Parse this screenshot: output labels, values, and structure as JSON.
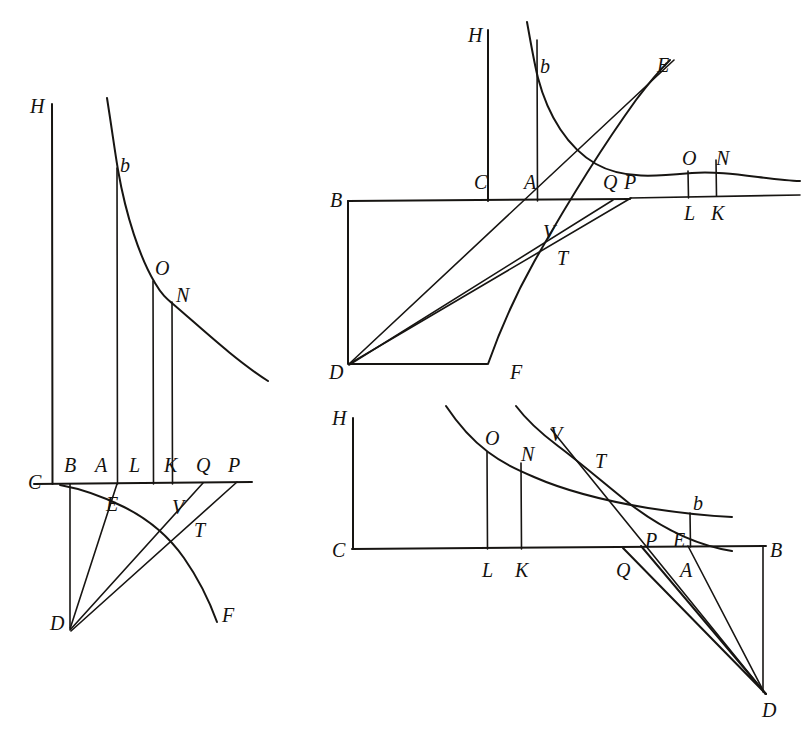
{
  "figure_set": {
    "title": "Geometric construction diagrams",
    "count": 3,
    "ink_color": "#171512",
    "background_color": "#ffffff"
  },
  "figures": [
    {
      "id": "figure-left",
      "name": "left-diagram",
      "labels": [
        {
          "key": "H",
          "text": "H",
          "x": 30,
          "y": 96
        },
        {
          "key": "b",
          "text": "b",
          "x": 120,
          "y": 155
        },
        {
          "key": "O",
          "text": "O",
          "x": 155,
          "y": 258
        },
        {
          "key": "N",
          "text": "N",
          "x": 176,
          "y": 285
        },
        {
          "key": "B",
          "text": "B",
          "x": 64,
          "y": 455
        },
        {
          "key": "A",
          "text": "A",
          "x": 95,
          "y": 455
        },
        {
          "key": "L",
          "text": "L",
          "x": 129,
          "y": 455
        },
        {
          "key": "K",
          "text": "K",
          "x": 164,
          "y": 455
        },
        {
          "key": "Q",
          "text": "Q",
          "x": 196,
          "y": 455
        },
        {
          "key": "P",
          "text": "P",
          "x": 228,
          "y": 455
        },
        {
          "key": "C",
          "text": "C",
          "x": 28,
          "y": 472
        },
        {
          "key": "E",
          "text": "E",
          "x": 106,
          "y": 494
        },
        {
          "key": "V",
          "text": "V",
          "x": 172,
          "y": 497
        },
        {
          "key": "T",
          "text": "T",
          "x": 194,
          "y": 520
        },
        {
          "key": "D",
          "text": "D",
          "x": 50,
          "y": 613
        },
        {
          "key": "F",
          "text": "F",
          "x": 222,
          "y": 605
        }
      ]
    },
    {
      "id": "figure-top-right",
      "name": "top-right-diagram",
      "labels": [
        {
          "key": "H",
          "text": "H",
          "x": 468,
          "y": 25
        },
        {
          "key": "b",
          "text": "b",
          "x": 540,
          "y": 56
        },
        {
          "key": "E",
          "text": "E",
          "x": 657,
          "y": 55
        },
        {
          "key": "O",
          "text": "O",
          "x": 682,
          "y": 148
        },
        {
          "key": "N",
          "text": "N",
          "x": 716,
          "y": 148
        },
        {
          "key": "C",
          "text": "C",
          "x": 474,
          "y": 172
        },
        {
          "key": "A",
          "text": "A",
          "x": 524,
          "y": 172
        },
        {
          "key": "Q",
          "text": "Q",
          "x": 603,
          "y": 172
        },
        {
          "key": "P",
          "text": "P",
          "x": 624,
          "y": 172
        },
        {
          "key": "B",
          "text": "B",
          "x": 330,
          "y": 190
        },
        {
          "key": "L",
          "text": "L",
          "x": 684,
          "y": 203
        },
        {
          "key": "K",
          "text": "K",
          "x": 711,
          "y": 203
        },
        {
          "key": "V",
          "text": "V",
          "x": 543,
          "y": 222
        },
        {
          "key": "T",
          "text": "T",
          "x": 557,
          "y": 248
        },
        {
          "key": "D",
          "text": "D",
          "x": 329,
          "y": 362
        },
        {
          "key": "F",
          "text": "F",
          "x": 510,
          "y": 362
        }
      ]
    },
    {
      "id": "figure-bottom-right",
      "name": "bottom-right-diagram",
      "labels": [
        {
          "key": "H",
          "text": "H",
          "x": 332,
          "y": 408
        },
        {
          "key": "O",
          "text": "O",
          "x": 485,
          "y": 428
        },
        {
          "key": "V",
          "text": "V",
          "x": 550,
          "y": 424
        },
        {
          "key": "N",
          "text": "N",
          "x": 521,
          "y": 444
        },
        {
          "key": "T",
          "text": "T",
          "x": 595,
          "y": 451
        },
        {
          "key": "b",
          "text": "b",
          "x": 693,
          "y": 493
        },
        {
          "key": "P",
          "text": "P",
          "x": 645,
          "y": 530
        },
        {
          "key": "E",
          "text": "E",
          "x": 673,
          "y": 530
        },
        {
          "key": "C",
          "text": "C",
          "x": 332,
          "y": 540
        },
        {
          "key": "B",
          "text": "B",
          "x": 770,
          "y": 540
        },
        {
          "key": "L",
          "text": "L",
          "x": 482,
          "y": 560
        },
        {
          "key": "K",
          "text": "K",
          "x": 515,
          "y": 560
        },
        {
          "key": "Q",
          "text": "Q",
          "x": 616,
          "y": 560
        },
        {
          "key": "A",
          "text": "A",
          "x": 680,
          "y": 560
        },
        {
          "key": "D",
          "text": "D",
          "x": 762,
          "y": 700
        }
      ]
    }
  ],
  "geometry": {
    "figure_left": {
      "baseline": {
        "x1": 34,
        "y1": 484,
        "x2": 252,
        "y2": 482
      },
      "vertical_H": {
        "x1": 52,
        "y1": 104,
        "x2": 52,
        "y2": 484
      },
      "vertical_A": {
        "x1": 117,
        "y1": 168,
        "x2": 117,
        "y2": 484
      },
      "vertical_L": {
        "x1": 153,
        "y1": 281,
        "x2": 153,
        "y2": 484
      },
      "vertical_K": {
        "x1": 172,
        "y1": 302,
        "x2": 172,
        "y2": 484
      },
      "vertical_B_to_D": {
        "x1": 70,
        "y1": 484,
        "x2": 70,
        "y2": 628
      },
      "hyperbola": "from (108,100) through b(117,168) O(153,281) N(172,302) to (268,380)",
      "arc_CF": "from C(62,486) through E(122,505) V(178,512) T(190,527) to F(218,622)",
      "ray_D_to_Q": {
        "x1": 70,
        "y1": 630,
        "x2": 202,
        "y2": 483
      },
      "ray_D_to_P": {
        "x1": 70,
        "y1": 630,
        "x2": 236,
        "y2": 482
      },
      "ray_D_to_E_A": {
        "x1": 70,
        "y1": 630,
        "x2": 117,
        "y2": 484
      }
    },
    "figure_top_right": {
      "baseline": {
        "x1": 348,
        "y1": 201,
        "x2": 800,
        "y2": 198
      },
      "vertical_H": {
        "x1": 487,
        "y1": 30,
        "x2": 487,
        "y2": 201
      },
      "vertical_A": {
        "x1": 537,
        "y1": 40,
        "x2": 537,
        "y2": 201
      },
      "rect_BDF": "B(348,201) D(348,364) F(487,364)",
      "vertical_L": {
        "x1": 688,
        "y1": 172,
        "x2": 688,
        "y2": 199
      },
      "vertical_K": {
        "x1": 716,
        "y1": 160,
        "x2": 716,
        "y2": 198
      },
      "hyperbola": "from (527,25) through b(537,75) down to O(688,172) N(716,180) to (800,184)",
      "arc_F": "from F(487,364) through T(553,238) to E(662,68)",
      "ray_D_to_E": {
        "x1": 348,
        "y1": 364,
        "x2": 672,
        "y2": 62
      },
      "ray_D_to_P": {
        "x1": 348,
        "y1": 364,
        "x2": 630,
        "y2": 198
      },
      "ray_D_to_Q": {
        "x1": 348,
        "y1": 364,
        "x2": 612,
        "y2": 200
      },
      "segment_P_right": {
        "x1": 630,
        "y1": 198,
        "x2": 800,
        "y2": 196
      }
    },
    "figure_bottom_right": {
      "baseline": {
        "x1": 352,
        "y1": 549,
        "x2": 766,
        "y2": 546
      },
      "vertical_H": {
        "x1": 352,
        "y1": 418,
        "x2": 352,
        "y2": 549
      },
      "vertical_L": {
        "x1": 487,
        "y1": 452,
        "x2": 487,
        "y2": 549
      },
      "vertical_K": {
        "x1": 521,
        "y1": 462,
        "x2": 521,
        "y2": 549
      },
      "vertical_B_D": {
        "x1": 763,
        "y1": 546,
        "x2": 763,
        "y2": 692
      },
      "hyperbola": "from (447,410) through O(487,452) N(521,462) T(600,490) b(691,512) to (730,518)",
      "arc_D": "from (516,408) through V(556,440) T(600,478) to (700,545)",
      "ray_D_to_Q": {
        "x1": 766,
        "y1": 694,
        "x2": 622,
        "y2": 548
      },
      "ray_D_to_P": {
        "x1": 766,
        "y1": 694,
        "x2": 640,
        "y2": 546
      },
      "ray_D_to_A": {
        "x1": 766,
        "y1": 694,
        "x2": 688,
        "y2": 546
      },
      "ray_D_to_V": {
        "x1": 766,
        "y1": 694,
        "x2": 551,
        "y2": 430
      }
    }
  }
}
